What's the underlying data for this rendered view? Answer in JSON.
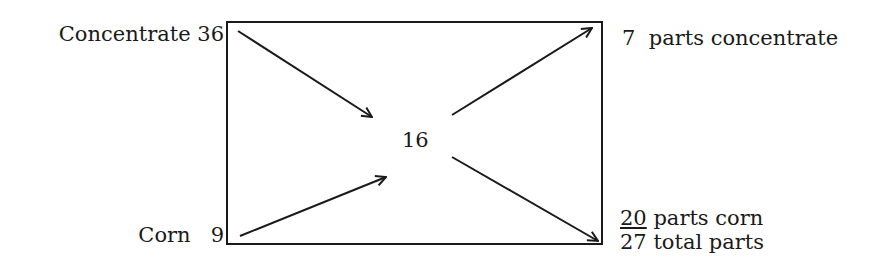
{
  "diagram": {
    "type": "pearson-square",
    "inputs": [
      {
        "name": "Concentrate",
        "value": "36",
        "label": "Concentrate 36"
      },
      {
        "name": "Corn",
        "value": "9",
        "label_name": "Corn",
        "label_value": "9"
      }
    ],
    "target": "16",
    "outputs": [
      {
        "parts": "7",
        "text": "parts concentrate"
      },
      {
        "parts": "20",
        "text": "parts corn"
      },
      {
        "parts": "27",
        "text": "total parts"
      }
    ],
    "colors": {
      "ink": "#1a1a1a",
      "background": "#ffffff"
    }
  }
}
